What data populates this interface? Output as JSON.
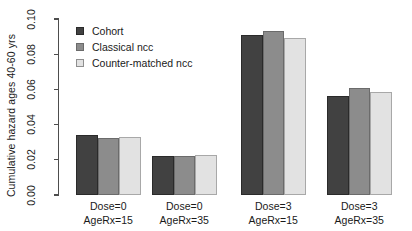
{
  "chart_data": {
    "type": "bar",
    "title": "",
    "xlabel": "",
    "ylabel": "Cumulative hazard ages 40-60 yrs",
    "ylim": [
      0.0,
      0.1
    ],
    "grid": false,
    "legend_position": "top-left",
    "categories": [
      "Dose=0\nAgeRx=15",
      "Dose=0\nAgeRx=35",
      "Dose=3\nAgeRx=15",
      "Dose=3\nAgeRx=35"
    ],
    "category_lines": [
      [
        "Dose=0",
        "AgeRx=15"
      ],
      [
        "Dose=0",
        "AgeRx=35"
      ],
      [
        "Dose=3",
        "AgeRx=15"
      ],
      [
        "Dose=3",
        "AgeRx=35"
      ]
    ],
    "series": [
      {
        "name": "Cohort",
        "color": "#414141",
        "values": [
          0.0343,
          0.0223,
          0.0909,
          0.056
        ]
      },
      {
        "name": "Classical ncc",
        "color": "#8c8c8c",
        "values": [
          0.0326,
          0.0223,
          0.0931,
          0.0606
        ]
      },
      {
        "name": "Counter-matched ncc",
        "color": "#e2e2e2",
        "values": [
          0.0329,
          0.0229,
          0.0891,
          0.0583
        ]
      }
    ],
    "ytick_labels": [
      "0.00",
      "0.02",
      "0.04",
      "0.06",
      "0.08",
      "0.10"
    ],
    "ytick_values": [
      0.0,
      0.02,
      0.04,
      0.06,
      0.08,
      0.1
    ]
  },
  "legend": {
    "items": [
      {
        "label": "Cohort"
      },
      {
        "label": "Classical ncc"
      },
      {
        "label": "Counter-matched ncc"
      }
    ]
  },
  "axis": {
    "y_title": "Cumulative hazard ages 40-60 yrs"
  }
}
